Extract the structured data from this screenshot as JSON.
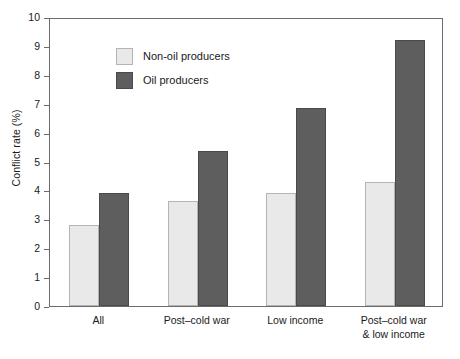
{
  "chart_data": {
    "type": "bar",
    "title": "",
    "xlabel": "",
    "ylabel": "Conflict rate (%)",
    "ylim": [
      0,
      10
    ],
    "ytick_step": 1,
    "yticks": [
      "10",
      "9",
      "8",
      "7",
      "6",
      "5",
      "4",
      "3",
      "2",
      "1",
      "0"
    ],
    "grid": false,
    "legend_position": "top-left",
    "categories": [
      "All",
      "Post–cold war",
      "Low income",
      "Post–cold war\n& low income"
    ],
    "series": [
      {
        "name": "Non-oil producers",
        "color": "#e9e9e9",
        "values": [
          2.8,
          3.65,
          3.9,
          4.3
        ]
      },
      {
        "name": "Oil producers",
        "color": "#5e5e5e",
        "values": [
          3.9,
          5.35,
          6.85,
          9.2
        ]
      }
    ]
  },
  "axes": {
    "y_title": "Conflict rate (%)"
  },
  "legend": {
    "items": [
      {
        "label": "Non-oil producers",
        "swatch": "nonoil"
      },
      {
        "label": "Oil producers",
        "swatch": "oil"
      }
    ]
  }
}
